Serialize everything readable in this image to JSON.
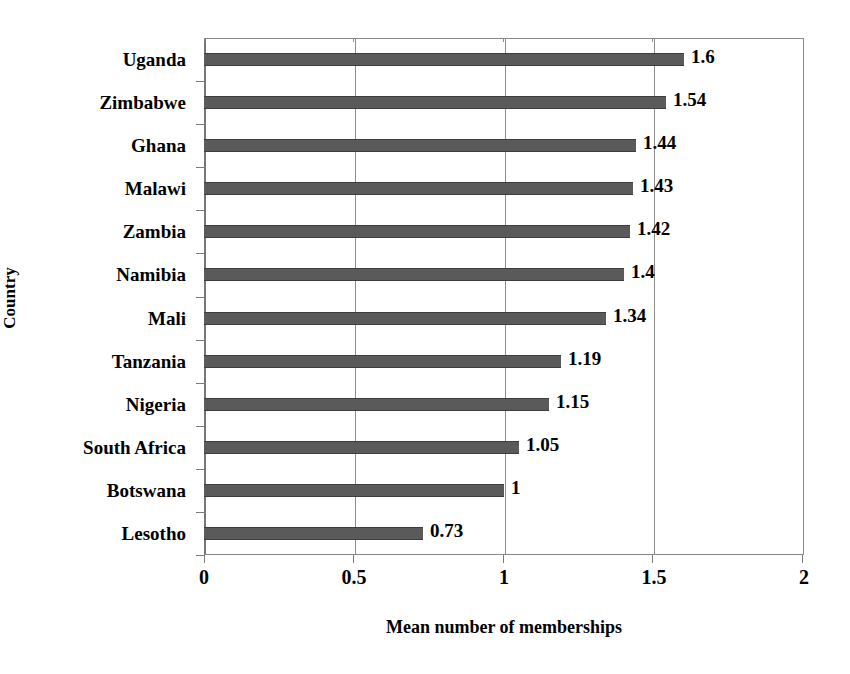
{
  "chart_data": {
    "type": "bar",
    "orientation": "horizontal",
    "title": "",
    "xlabel": "Mean number of memberships",
    "ylabel": "Country",
    "categories": [
      "Uganda",
      "Zimbabwe",
      "Ghana",
      "Malawi",
      "Zambia",
      "Namibia",
      "Mali",
      "Tanzania",
      "Nigeria",
      "South Africa",
      "Botswana",
      "Lesotho"
    ],
    "values": [
      1.6,
      1.54,
      1.44,
      1.43,
      1.42,
      1.4,
      1.34,
      1.19,
      1.15,
      1.05,
      1,
      0.73
    ],
    "value_labels": [
      "1.6",
      "1.54",
      "1.44",
      "1.43",
      "1.42",
      "1.4",
      "1.34",
      "1.19",
      "1.15",
      "1.05",
      "1",
      "0.73"
    ],
    "xlim": [
      0,
      2
    ],
    "xticks": [
      0,
      0.5,
      1,
      1.5,
      2
    ],
    "xtick_labels": [
      "0",
      "0.5",
      "1",
      "1.5",
      "2"
    ],
    "grid": "vertical",
    "legend": "none",
    "bar_color": "#5a5a5a",
    "axis_color": "#8d8d8d",
    "background_color": "#ffffff"
  }
}
